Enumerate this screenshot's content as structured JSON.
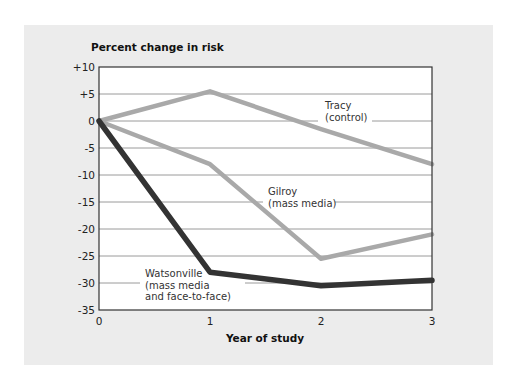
{
  "chart_data": {
    "type": "line",
    "title": "",
    "ylabel": "Percent change in risk",
    "xlabel": "Year of study",
    "x": [
      0,
      1,
      2,
      3
    ],
    "xticks": [
      "0",
      "1",
      "2",
      "3"
    ],
    "yticks": [
      "+10",
      "+5",
      "0",
      "-5",
      "-10",
      "-15",
      "-20",
      "-25",
      "-30",
      "-35"
    ],
    "ylim": [
      -35,
      10
    ],
    "xlim": [
      0,
      3
    ],
    "grid": true,
    "legend_position": "inline labels",
    "series": [
      {
        "name": "Tracy (control)",
        "label_lines": [
          "Tracy",
          "(control)"
        ],
        "values": [
          0,
          5.5,
          -1.5,
          -8
        ],
        "color": "#a9a9a9"
      },
      {
        "name": "Gilroy (mass media)",
        "label_lines": [
          "Gilroy",
          "(mass media)"
        ],
        "values": [
          0,
          -8,
          -25.5,
          -21
        ],
        "color": "#a9a9a9"
      },
      {
        "name": "Watsonville (mass media and face-to-face)",
        "label_lines": [
          "Watsonville",
          "(mass media",
          "and face-to-face)"
        ],
        "values": [
          0,
          -28,
          -30.5,
          -29.5
        ],
        "color": "#333333"
      }
    ]
  }
}
